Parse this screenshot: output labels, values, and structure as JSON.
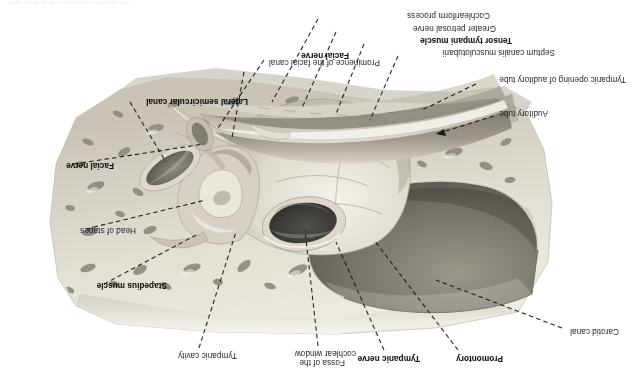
{
  "figure": {
    "orientation_deg": 180,
    "edge_text": "the tympanic cavity and the auditory tube",
    "palette": {
      "background": "#ffffff",
      "bone_light": "#e9e7de",
      "bone_mid": "#cfcabb",
      "bone_shadow": "#9e9a8e",
      "cell_dark": "#6f6c64",
      "cavity_dark": "#4a4843",
      "mucosa": "#b9b2a4",
      "leader": "#1a1a1a",
      "label": "#1d1d1d"
    }
  },
  "labels": [
    {
      "id": "carotid-canal",
      "text": "Carotid canal",
      "bold": false,
      "x": 17,
      "y": 58,
      "align": "left"
    },
    {
      "id": "promontory",
      "text": "Promontory",
      "bold": true,
      "x": 133,
      "y": 31,
      "align": "left"
    },
    {
      "id": "tympanic-nerve",
      "text": "Tympanic nerve",
      "bold": true,
      "x": 216,
      "y": 31,
      "align": "left"
    },
    {
      "id": "fossa-cochlear-window-l1",
      "text": "Fossa of the",
      "bold": false,
      "x": 291,
      "y": 27,
      "align": "center"
    },
    {
      "id": "fossa-cochlear-window-l2",
      "text": "cochlear window",
      "bold": false,
      "x": 287,
      "y": 36,
      "align": "center"
    },
    {
      "id": "tympanic-cavity",
      "text": "Tympanic cavity",
      "bold": false,
      "x": 399,
      "y": 34,
      "align": "left"
    },
    {
      "id": "stapedius-muscle",
      "text": "Stapedius muscle",
      "bold": true,
      "x": 538,
      "y": 104,
      "align": "right"
    },
    {
      "id": "head-of-stapes",
      "text": "Head of stapes",
      "bold": false,
      "x": 556,
      "y": 159,
      "align": "right"
    },
    {
      "id": "facial-nerve-right",
      "text": "Facial nerve",
      "bold": true,
      "x": 567,
      "y": 224,
      "align": "right"
    },
    {
      "id": "lateral-semicircular-canal",
      "text": "Lateral semicircular canal",
      "bold": true,
      "x": 512,
      "y": 288,
      "align": "right"
    },
    {
      "id": "prominence-of-facial-canal",
      "text": "Prominence of the facial canal",
      "bold": false,
      "x": 395,
      "y": 327,
      "align": "left"
    },
    {
      "id": "facial-nerve-bottom",
      "text": "Facial nerve",
      "bold": true,
      "x": 331,
      "y": 334,
      "align": "left"
    },
    {
      "id": "auditory-tube",
      "text": "Auditory tube",
      "bold": false,
      "x": 88,
      "y": 276,
      "align": "left"
    },
    {
      "id": "tympanic-opening-auditory-tube",
      "text": "Tympanic opening of auditory tube",
      "bold": false,
      "x": 10,
      "y": 310,
      "align": "left"
    },
    {
      "id": "septum-canalis-musculotubarii",
      "text": "Septum canalis musculotubarii",
      "bold": false,
      "x": 81,
      "y": 337,
      "align": "left"
    },
    {
      "id": "tensor-tympani-muscle",
      "text": "Tensor tympani muscle",
      "bold": true,
      "x": 124,
      "y": 349,
      "align": "left"
    },
    {
      "id": "greater-petrosal-nerve",
      "text": "Greater petrosal nerve",
      "bold": false,
      "x": 140,
      "y": 361,
      "align": "left"
    },
    {
      "id": "cochleariform-process",
      "text": "Cochleariform process",
      "bold": false,
      "x": 146,
      "y": 374,
      "align": "left"
    }
  ],
  "structures": [
    {
      "id": "carotid-canal-opening",
      "name": "Carotid canal",
      "tone": "cavity_dark"
    },
    {
      "id": "promontory-body",
      "name": "Promontory",
      "tone": "bone_light"
    },
    {
      "id": "cochlear-window-fossa",
      "name": "Fossa of the cochlear window",
      "tone": "cell_dark"
    },
    {
      "id": "mastoid-air-cells",
      "name": "Mastoid air cells",
      "tone": "bone_mid"
    },
    {
      "id": "lateral-semicircular",
      "name": "Lateral semicircular canal",
      "tone": "cell_dark"
    },
    {
      "id": "auditory-tube-canal",
      "name": "Auditory tube",
      "tone": "mucosa"
    },
    {
      "id": "stapes",
      "name": "Head of stapes",
      "tone": "bone_light"
    },
    {
      "id": "facial-canal-prominence",
      "name": "Prominence of the facial canal",
      "tone": "bone_mid"
    }
  ]
}
